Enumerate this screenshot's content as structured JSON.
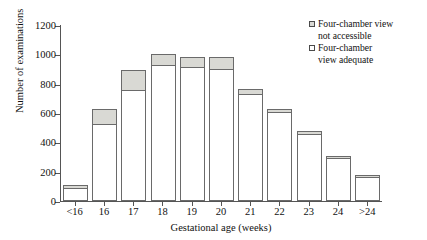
{
  "chart_data": {
    "type": "bar",
    "subtype": "stacked",
    "title": "",
    "xlabel": "Gestational age (weeks)",
    "ylabel": "Number of examinations",
    "categories": [
      "<16",
      "16",
      "17",
      "18",
      "19",
      "20",
      "21",
      "22",
      "23",
      "24",
      ">24"
    ],
    "ylim": [
      0,
      1200
    ],
    "yticks": [
      0,
      200,
      400,
      600,
      800,
      1000,
      1200
    ],
    "ytick_labels": [
      "0",
      "200",
      "400",
      "600",
      "800",
      "1000",
      "1200"
    ],
    "grid": false,
    "legend_position": "top-right",
    "series": [
      {
        "name": "Four-chamber view adequate",
        "color": "#ffffff",
        "values": [
          90,
          525,
          760,
          925,
          915,
          900,
          730,
          605,
          460,
          295,
          165
        ]
      },
      {
        "name": "Four-chamber view not accessible",
        "color": "#d9d9d4",
        "values": [
          20,
          105,
          130,
          80,
          70,
          85,
          35,
          25,
          20,
          15,
          10
        ]
      }
    ],
    "totals": [
      110,
      630,
      890,
      1005,
      985,
      985,
      765,
      630,
      480,
      310,
      175
    ]
  },
  "legend": {
    "items": [
      {
        "label": "Four-chamber view\nnot accessible",
        "swatch": "gray"
      },
      {
        "label": "Four-chamber\nview adequate",
        "swatch": "white"
      }
    ]
  },
  "axes": {
    "y_title": "Number of examinations",
    "x_title": "Gestational age (weeks)"
  }
}
